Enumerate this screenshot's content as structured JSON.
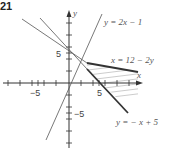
{
  "problem_number": "21",
  "axes": {
    "x_label": "x",
    "y_label": "y",
    "x_tick_labels": [
      "−5",
      "5"
    ],
    "y_tick_labels": [
      "5",
      "−5"
    ]
  },
  "lines": [
    {
      "id": "line1",
      "equation_label": "y = 2x − 1",
      "style": "thin"
    },
    {
      "id": "line2",
      "equation_label": "x = 12 − 2y",
      "style": "thin with thick boundary segment"
    },
    {
      "id": "line3",
      "equation_label": "y = − x + 5",
      "style": "thin with thick boundary segment"
    }
  ],
  "shaded_region": {
    "description": "hatched region between x = 12 − 2y and y = −x + 5, right of y = 2x − 1"
  },
  "colors": {
    "axis": "#333333",
    "line": "#555555",
    "boundary": "#333333",
    "hatch": "#aaaaaa"
  }
}
